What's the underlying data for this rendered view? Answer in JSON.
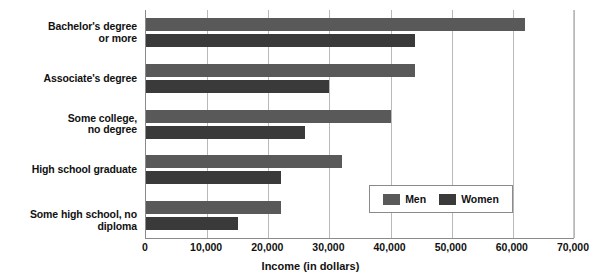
{
  "chart_data": {
    "type": "bar",
    "orientation": "horizontal",
    "title": "",
    "xlabel": "Income (in dollars)",
    "ylabel": "",
    "xlim": [
      0,
      70000
    ],
    "xticks": [
      "0",
      "10,000",
      "20,000",
      "30,000",
      "40,000",
      "50,000",
      "60,000",
      "70,000"
    ],
    "xtick_values": [
      0,
      10000,
      20000,
      30000,
      40000,
      50000,
      60000,
      70000
    ],
    "grid": "vertical",
    "legend_position": "inside-lower-right",
    "categories": [
      "Bachelor's degree\nor more",
      "Associate's degree",
      "Some college,\nno degree",
      "High school graduate",
      "Some high school, no diploma"
    ],
    "category_lines": [
      [
        "Bachelor's degree",
        "or more"
      ],
      [
        "Associate's degree"
      ],
      [
        "Some college,",
        "no degree"
      ],
      [
        "High school graduate"
      ],
      [
        "Some high school, no diploma"
      ]
    ],
    "series": [
      {
        "name": "Men",
        "color": "#595959",
        "values": [
          62000,
          44000,
          40000,
          32000,
          22000
        ]
      },
      {
        "name": "Women",
        "color": "#3a3a3a",
        "values": [
          44000,
          30000,
          26000,
          22000,
          15000
        ]
      }
    ]
  },
  "legend": {
    "entries": [
      {
        "label": "Men"
      },
      {
        "label": "Women"
      }
    ]
  },
  "axis": {
    "x_title": "Income (in dollars)"
  }
}
